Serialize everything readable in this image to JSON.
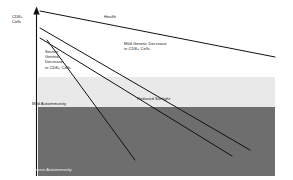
{
  "figure": {
    "axis": {
      "y_title": "CD8+\nCells"
    },
    "bands": [
      {
        "name": "health-band",
        "label": "",
        "color": "#ffffff",
        "y_top": 27,
        "y_bottom": 77
      },
      {
        "name": "mild-autoimmunity-band",
        "label": "Mild Autoimmunity",
        "color": "#e9e9e9",
        "y_top": 77,
        "y_bottom": 107
      },
      {
        "name": "severe-autoimmunity-band",
        "label": "Severe Autoimmunity",
        "color": "#6e6e6e",
        "y_top": 107,
        "y_bottom": 176
      }
    ],
    "lines": [
      {
        "name": "health-line",
        "label": "Health",
        "x1": 40,
        "y1": 11,
        "x2": 275,
        "y2": 57
      },
      {
        "name": "mild-genetic-decrease-line",
        "label": "Mild Genetic Decrease\nin CD8+ Cells",
        "x1": 40,
        "y1": 28,
        "x2": 250,
        "y2": 150
      },
      {
        "name": "reduced-sunlight-line",
        "label": "Reduced Sunlight",
        "x1": 40,
        "y1": 38,
        "x2": 232,
        "y2": 156
      },
      {
        "name": "severe-genetic-decrease-line",
        "label": "Severe Genetic Decrease\nin CD8+ Cells",
        "x1": 47,
        "y1": 40,
        "x2": 135,
        "y2": 160
      }
    ],
    "labels": {
      "health": "Health",
      "mild_genetic_decrease": "Mild Genetic Decrease\nin CD8+ Cells",
      "severe_genetic_decrease": "Severe\nGenetic\nDecrease\nin CD8+ Cells",
      "reduced_sunlight": "Reduced Sunlight",
      "mild_autoimmunity": "Mild Autoimmunity",
      "severe_autoimmunity": "Severe Autoimmunity"
    },
    "colors": {
      "line": "#111111",
      "axis": "#111111",
      "band_health": "#ffffff",
      "band_mild": "#e9e9e9",
      "band_severe": "#6e6e6e",
      "text_dark": "#1a1a1a",
      "text_light": "#f2f2f2"
    }
  }
}
